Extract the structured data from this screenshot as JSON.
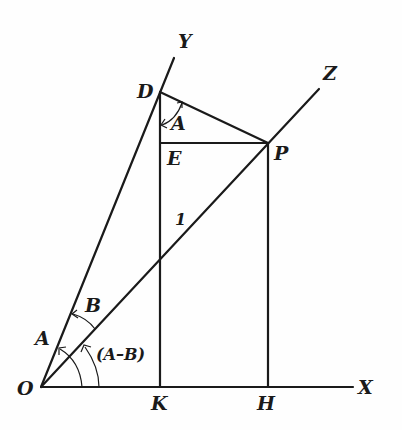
{
  "diagram": {
    "points": {
      "O": {
        "label": "O",
        "x": 41,
        "y": 387
      },
      "X": {
        "label": "X",
        "x": 353,
        "y": 387
      },
      "Y": {
        "label": "Y",
        "x": 174,
        "y": 58
      },
      "Z": {
        "label": "Z",
        "x": 319,
        "y": 89
      },
      "D": {
        "label": "D",
        "x": 160,
        "y": 92
      },
      "E": {
        "label": "E",
        "x": 160,
        "y": 143
      },
      "P": {
        "label": "P",
        "x": 268,
        "y": 143
      },
      "K": {
        "label": "K",
        "x": 160,
        "y": 387
      },
      "H": {
        "label": "H",
        "x": 268,
        "y": 387
      }
    },
    "labels": {
      "O": "O",
      "X": "X",
      "Y": "Y",
      "Z": "Z",
      "D": "D",
      "E": "E",
      "P": "P",
      "K": "K",
      "H": "H",
      "angle_A_at_D": "A",
      "angle_A_at_O": "A",
      "angle_B": "B",
      "angle_A_minus_B": "(A–B)",
      "segment_OP_length": "1"
    },
    "segments": [
      {
        "from": "O",
        "to": "X"
      },
      {
        "from": "O",
        "to": "Y"
      },
      {
        "from": "O",
        "to": "Z"
      },
      {
        "from": "D",
        "to": "K"
      },
      {
        "from": "D",
        "to": "P"
      },
      {
        "from": "E",
        "to": "P"
      },
      {
        "from": "P",
        "to": "H"
      }
    ],
    "colors": {
      "ink": "#1a1a1a",
      "paper": "#fefefe"
    }
  }
}
